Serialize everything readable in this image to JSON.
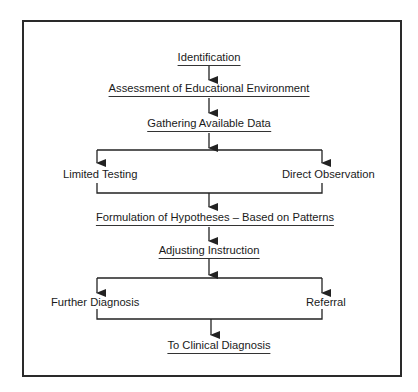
{
  "diagram": {
    "type": "flowchart",
    "colors": {
      "line": "#222222",
      "text": "#1a1a1a",
      "border": "#2a2a2a",
      "background": "#ffffff"
    },
    "nodes": {
      "identification": "Identification",
      "assessment": "Assessment of Educational Environment",
      "gathering": "Gathering Available Data",
      "limited_testing": "Limited Testing",
      "direct_observation": "Direct Observation",
      "formulation": "Formulation of Hypotheses – Based on Patterns",
      "adjusting": "Adjusting Instruction",
      "further_diagnosis": "Further Diagnosis",
      "referral": "Referral",
      "clinical": "To Clinical Diagnosis"
    },
    "edges": [
      [
        "identification",
        "assessment"
      ],
      [
        "assessment",
        "gathering"
      ],
      [
        "gathering",
        "limited_testing"
      ],
      [
        "gathering",
        "direct_observation"
      ],
      [
        "limited_testing",
        "formulation"
      ],
      [
        "direct_observation",
        "formulation"
      ],
      [
        "formulation",
        "adjusting"
      ],
      [
        "adjusting",
        "further_diagnosis"
      ],
      [
        "adjusting",
        "referral"
      ],
      [
        "further_diagnosis",
        "clinical"
      ],
      [
        "referral",
        "clinical"
      ]
    ]
  }
}
